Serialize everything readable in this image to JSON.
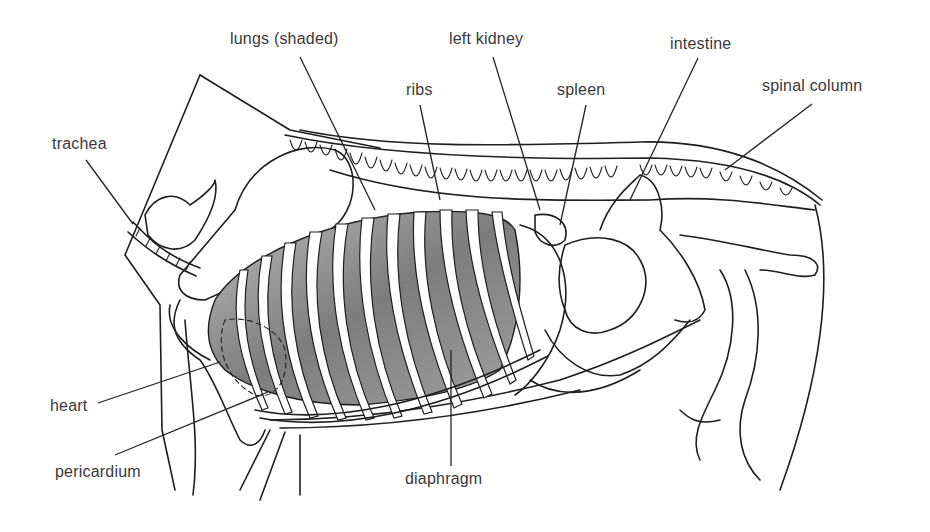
{
  "figure": {
    "colors": {
      "ink": "#1e1e1e",
      "label_text": "#3a3a3a",
      "lung_shade": "#8a8a8a",
      "background": "#ffffff"
    }
  },
  "labels": [
    {
      "id": "trachea",
      "text": "trachea",
      "x": 52,
      "y": 135,
      "leader": [
        [
          86,
          160
        ],
        [
          133,
          224
        ]
      ]
    },
    {
      "id": "lungs",
      "text": "lungs (shaded)",
      "x": 230,
      "y": 30,
      "leader": [
        [
          300,
          57
        ],
        [
          375,
          210
        ]
      ]
    },
    {
      "id": "ribs",
      "text": "ribs",
      "x": 406,
      "y": 81,
      "leader": [
        [
          420,
          105
        ],
        [
          440,
          200
        ]
      ]
    },
    {
      "id": "left-kidney",
      "text": "left kidney",
      "x": 449,
      "y": 30,
      "leader": [
        [
          493,
          57
        ],
        [
          540,
          210
        ]
      ]
    },
    {
      "id": "spleen",
      "text": "spleen",
      "x": 557,
      "y": 81,
      "leader": [
        [
          586,
          105
        ],
        [
          560,
          225
        ]
      ]
    },
    {
      "id": "intestine",
      "text": "intestine",
      "x": 670,
      "y": 35,
      "leader": [
        [
          698,
          58
        ],
        [
          630,
          200
        ]
      ]
    },
    {
      "id": "spinal-column",
      "text": "spinal column",
      "x": 762,
      "y": 77,
      "leader": [
        [
          812,
          104
        ],
        [
          725,
          170
        ]
      ]
    },
    {
      "id": "heart",
      "text": "heart",
      "x": 50,
      "y": 397,
      "leader": [
        [
          98,
          403
        ],
        [
          220,
          362
        ]
      ]
    },
    {
      "id": "pericardium",
      "text": "pericardium",
      "x": 55,
      "y": 463,
      "leader": [
        [
          115,
          455
        ],
        [
          268,
          392
        ]
      ]
    },
    {
      "id": "diaphragm",
      "text": "diaphragm",
      "x": 405,
      "y": 470,
      "leader": [
        [
          451,
          466
        ],
        [
          451,
          350
        ]
      ]
    }
  ]
}
